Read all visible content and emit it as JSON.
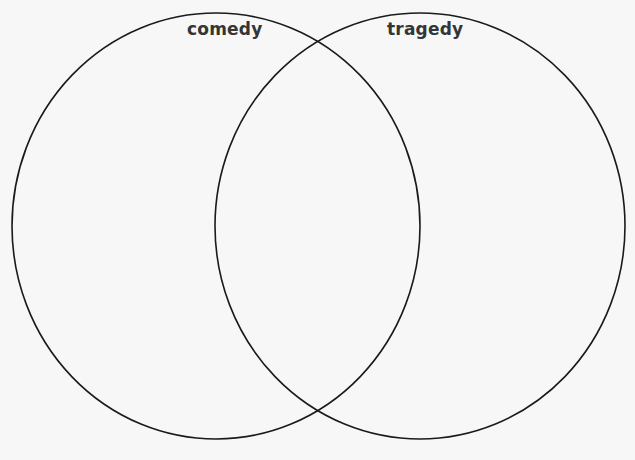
{
  "diagram": {
    "type": "venn",
    "sets": [
      {
        "id": "left",
        "label": "comedy",
        "cx": 216,
        "cy": 226,
        "rx": 204,
        "ry": 213
      },
      {
        "id": "right",
        "label": "tragedy",
        "cx": 420,
        "cy": 226,
        "rx": 205,
        "ry": 213
      }
    ],
    "stroke_color": "#1a1a1a",
    "background_color": "#f7f7f7",
    "label_color": "#353535"
  }
}
